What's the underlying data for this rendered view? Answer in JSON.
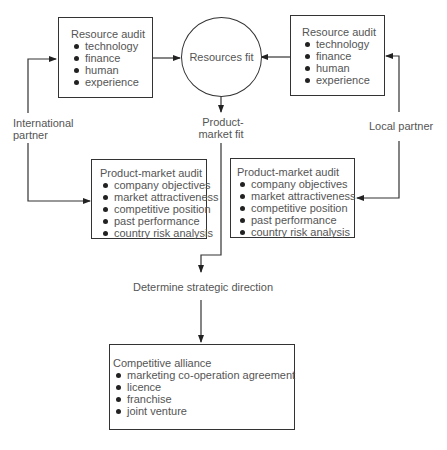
{
  "resource_audit_left": {
    "title": "Resource audit",
    "items": [
      "technology",
      "finance",
      "human",
      "experience"
    ]
  },
  "resource_audit_right": {
    "title": "Resource audit",
    "items": [
      "technology",
      "finance",
      "human",
      "experience"
    ]
  },
  "resources_fit": {
    "label": "Resources fit"
  },
  "product_market_fit": {
    "line1": "Product-",
    "line2": "market fit"
  },
  "international_partner": {
    "line1": "International",
    "line2": "partner"
  },
  "local_partner": {
    "label": "Local partner"
  },
  "product_market_audit_left": {
    "title": "Product-market audit",
    "items": [
      "company objectives",
      "market attractiveness",
      "competitive position",
      "past performance",
      "country risk analysis"
    ]
  },
  "product_market_audit_right": {
    "title": "Product-market audit",
    "items": [
      "company objectives",
      "market attractiveness",
      "competitive position",
      "past performance",
      "country risk analysis"
    ]
  },
  "strategic_direction": {
    "label": "Determine strategic direction"
  },
  "competitive_alliance": {
    "title": "Competitive alliance",
    "items": [
      "marketing co-operation agreement",
      "licence",
      "franchise",
      "joint venture"
    ]
  }
}
